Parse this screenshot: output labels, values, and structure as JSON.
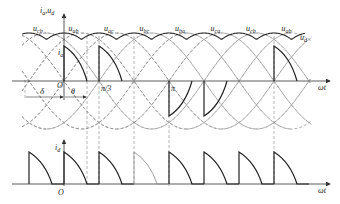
{
  "figure": {
    "upper_axis": {
      "y_label": "i_a, u_d",
      "x_label": "ωt",
      "origin": "O"
    },
    "lower_axis": {
      "y_label": "i_d",
      "x_label": "ωt",
      "origin": "O"
    },
    "voltage_labels": [
      {
        "main": "u",
        "sub": "cb"
      },
      {
        "main": "u",
        "sub": "ab"
      },
      {
        "main": "u",
        "sub": "ac"
      },
      {
        "main": "u",
        "sub": "bc"
      },
      {
        "main": "u",
        "sub": "ba"
      },
      {
        "main": "u",
        "sub": "ca"
      },
      {
        "main": "u",
        "sub": "cb"
      },
      {
        "main": "u",
        "sub": "ab"
      }
    ],
    "ud_label": {
      "main": "u",
      "sub": "d"
    },
    "ia_label": {
      "main": "i",
      "sub": "a"
    },
    "angle_labels": {
      "delta": "δ",
      "theta": "θ",
      "pi_over_3": "π/3",
      "pi": "π"
    },
    "colors": {
      "curve": "#222222",
      "dashed": "#777777",
      "axis": "#333333"
    }
  }
}
